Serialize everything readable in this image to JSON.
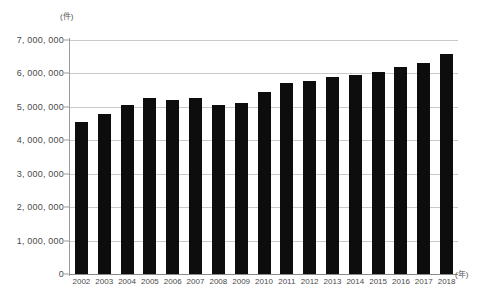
{
  "chart_data": {
    "type": "bar",
    "title": "",
    "subtitle": "",
    "xlabel": "(年)",
    "ylabel": "(件)",
    "categories": [
      "2002",
      "2003",
      "2004",
      "2005",
      "2006",
      "2007",
      "2008",
      "2009",
      "2010",
      "2011",
      "2012",
      "2013",
      "2014",
      "2015",
      "2016",
      "2017",
      "2018"
    ],
    "values": [
      4550000,
      4800000,
      5050000,
      5260000,
      5200000,
      5260000,
      5070000,
      5110000,
      5440000,
      5700000,
      5770000,
      5880000,
      5940000,
      6030000,
      6180000,
      6300000,
      6580000
    ],
    "series": [
      {
        "name": "件数",
        "values": [
          4550000,
          4800000,
          5050000,
          5260000,
          5200000,
          5260000,
          5070000,
          5110000,
          5440000,
          5700000,
          5770000,
          5880000,
          5940000,
          6030000,
          6180000,
          6300000,
          6580000
        ]
      }
    ],
    "ylim": [
      0,
      7000000
    ],
    "ytick_values": [
      0,
      1000000,
      2000000,
      3000000,
      4000000,
      5000000,
      6000000,
      7000000
    ],
    "ytick_labels": [
      "0",
      "1, 000, 000",
      "2, 000, 000",
      "3, 000, 000",
      "4, 000, 000",
      "5, 000, 000",
      "6, 000, 000",
      "7, 000, 000"
    ],
    "grid": true,
    "grid_axis": "y",
    "legend": false,
    "legend_position": "none",
    "bar_color": "#0d0d0d",
    "grid_color": "#c9c9c9",
    "axis_color": "#9a9a9a",
    "background_color": "#ffffff"
  }
}
